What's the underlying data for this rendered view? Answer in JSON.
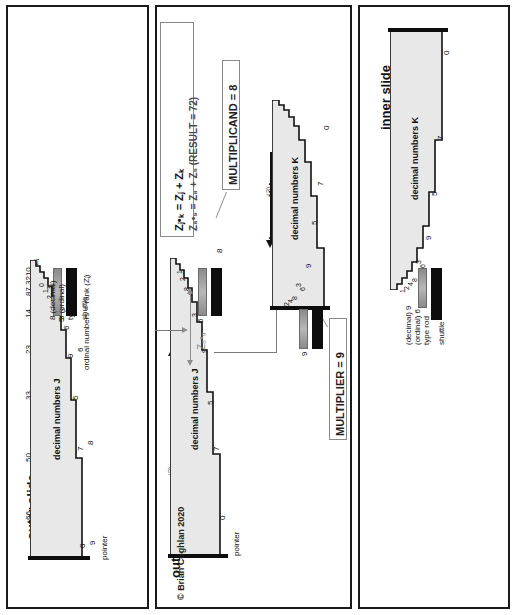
{
  "figure": {
    "copyright": "© Brian Coghlan 2020"
  },
  "colors": {
    "ink": "#111111",
    "grey_text": "#8d8d8d",
    "slide_fill": "#e8e8e8",
    "shuttle": "#0d0d0d",
    "type_rod": "#9a9a9a",
    "callout_border": "#8a8a8a"
  },
  "panel_left": {
    "heading": "outer slide",
    "axis_label": "logarithmic indexes Zⱼ",
    "axis_ticks": [
      "66",
      "50",
      "33",
      "23",
      "14",
      "87",
      "3210"
    ],
    "body_label": "decimal numbers J",
    "ordinal_label": "ordinal numbers = rank (Zⱼ)",
    "step_labels": [
      "9",
      "0",
      "7",
      "8",
      "5",
      "9",
      "6",
      "6",
      "5",
      "3",
      "4",
      "8",
      "2",
      "2",
      "1",
      "3",
      "0"
    ],
    "pointer_label": "pointer",
    "shuttle_label": "shuttle",
    "type_rod_label": "type rod",
    "decimal_label": "8 (decimal)",
    "ordinal_value_label": "3 (ordinal)"
  },
  "panel_middle": {
    "formula_line1": "Zⱼ•ₖ = Zⱼ + Zₖ",
    "formula_line2": "Z₈•₉ = Z₈ + Z₉  (RESULT = 72)",
    "multiplicand_box": "MULTIPLICAND = 8",
    "multiplier_box": "MULTIPLIER = 9",
    "outer_heading": "outer slide",
    "outer_step_marker": "(2)",
    "inner_heading": "inner slide",
    "inner_step_marker": "(3)",
    "outer_body_label": "decimal numbers J",
    "inner_body_label": "decimal numbers K",
    "z_sum_label": "Z₈•₉",
    "multiplicand_value": "8",
    "multiplier_value": "9",
    "pointer_label": "pointer",
    "outer_step_labels": [
      "0",
      "7",
      "5",
      "9",
      "6",
      "3",
      "4",
      "8",
      "2",
      "1"
    ],
    "inner_step_labels": [
      "0",
      "7",
      "5",
      "9",
      "6",
      "3",
      "8",
      "4",
      "2",
      "1"
    ],
    "copyright": "© Brian Coghlan 2020"
  },
  "panel_right": {
    "heading": "inner slide",
    "starting_position_label": "starting position",
    "body_label": "decimal numbers K",
    "step_labels": [
      "0",
      "7",
      "5",
      "9",
      "6",
      "3",
      "8",
      "4",
      "2",
      "1"
    ],
    "decimal_label": "(decimal) 9",
    "ordinal_label": "(ordinal) 6",
    "type_rod_label": "type rod",
    "shuttle_label": "shuttle"
  }
}
